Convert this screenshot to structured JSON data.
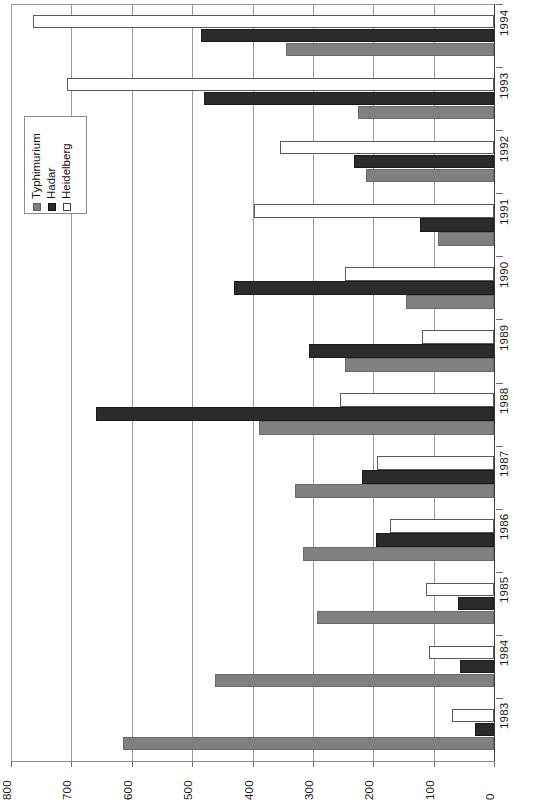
{
  "chart_data": {
    "type": "bar",
    "orientation": "horizontal-rotated",
    "title": "",
    "xlabel": "",
    "ylabel": "",
    "categories": [
      "1983",
      "1984",
      "1985",
      "1986",
      "1987",
      "1988",
      "1989",
      "1990",
      "1991",
      "1992",
      "1993",
      "1994"
    ],
    "value_axis": {
      "ticks": [
        0,
        100,
        200,
        300,
        400,
        500,
        600,
        700,
        800
      ],
      "tick_labels": [
        "0",
        "100",
        "200",
        "300",
        "400",
        "500",
        "600",
        "700",
        "800"
      ],
      "min": 0,
      "max": 800,
      "grid": true
    },
    "legend": {
      "position": "left",
      "entries": [
        {
          "name": "Typhimurium",
          "color": "#808080"
        },
        {
          "name": "Hadar",
          "color": "#2b2b2b"
        },
        {
          "name": "Heidelberg",
          "color": "#ffffff"
        }
      ]
    },
    "series": [
      {
        "name": "Typhimurium",
        "color": "#808080",
        "values": [
          615,
          462,
          293,
          317,
          330,
          390,
          247,
          145,
          92,
          212,
          225,
          345
        ]
      },
      {
        "name": "Hadar",
        "color": "#2b2b2b",
        "values": [
          32,
          57,
          60,
          195,
          218,
          660,
          307,
          430,
          122,
          232,
          480,
          485
        ]
      },
      {
        "name": "Heidelberg",
        "color": "#ffffff",
        "values": [
          70,
          108,
          112,
          173,
          193,
          255,
          120,
          247,
          398,
          355,
          708,
          763
        ]
      }
    ]
  }
}
